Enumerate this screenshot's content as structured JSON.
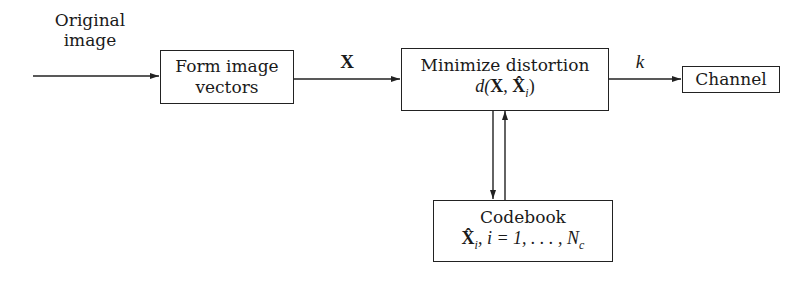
{
  "diagram": {
    "input_label": [
      "Original",
      "image"
    ],
    "blocks": {
      "form_vectors": {
        "lines": [
          "Form image",
          "vectors"
        ]
      },
      "minimize": {
        "line1": "Minimize distortion",
        "line2_prefix": "d(",
        "line2_X": "X",
        "line2_sep": ", ",
        "line2_Xhat": "X̂",
        "line2_sub": "i",
        "line2_suffix": ")"
      },
      "channel": {
        "label": "Channel"
      },
      "codebook": {
        "line1": "Codebook",
        "line2_Xhat": "X̂",
        "line2_sub": "i",
        "line2_rest": ", i = 1, . . . , N",
        "line2_sub2": "c"
      }
    },
    "edge_labels": {
      "vectors_to_minimize": "X",
      "minimize_to_channel": "k"
    },
    "edges": [
      {
        "from": "input",
        "to": "form_vectors"
      },
      {
        "from": "form_vectors",
        "to": "minimize",
        "label": "X"
      },
      {
        "from": "minimize",
        "to": "channel",
        "label": "k"
      },
      {
        "from": "minimize",
        "to": "codebook"
      },
      {
        "from": "codebook",
        "to": "minimize"
      }
    ]
  }
}
